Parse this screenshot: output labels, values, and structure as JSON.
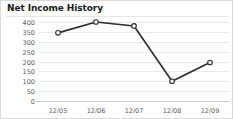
{
  "card": {
    "title": "Net Income History"
  },
  "chart_data": {
    "type": "line",
    "title": "Net Income History",
    "xlabel": "",
    "ylabel": "",
    "categories": [
      "12/05",
      "12/06",
      "12/07",
      "12/08",
      "12/09"
    ],
    "values": [
      345,
      400,
      380,
      100,
      195
    ],
    "series": [
      {
        "name": "Net Income",
        "values": [
          345,
          400,
          380,
          100,
          195
        ]
      }
    ],
    "ylim": [
      0,
      400
    ],
    "yticks": [
      0,
      50,
      100,
      150,
      200,
      250,
      300,
      350,
      400
    ],
    "ytick_labels": [
      "0",
      "50",
      "100",
      "150",
      "200",
      "250",
      "300",
      "350",
      "400"
    ],
    "xtick_labels": [
      "12/05",
      "12/06",
      "12/07",
      "12/08",
      "12/09"
    ],
    "grid": true,
    "grid_axis": "y",
    "legend": false,
    "legend_position": "none",
    "marker": "circle-open",
    "line_color": "#2b2b2b",
    "marker_fill": "#ffffff",
    "grid_color": "#e8e8e8",
    "axis_color": "#c9c9c9",
    "tick_label_color": "#5a5a5a",
    "title_color": "#1a1a1a",
    "background": "#ffffff"
  }
}
